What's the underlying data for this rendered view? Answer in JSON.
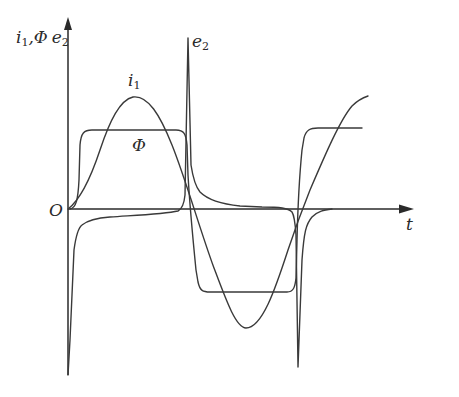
{
  "diagram": {
    "type": "waveform-diagram",
    "axes": {
      "y_label": {
        "parts": [
          "i",
          "1",
          ",Φ",
          "e",
          "2"
        ]
      },
      "x_label": "t",
      "origin_label": "O"
    },
    "curve_labels": {
      "i1": {
        "base": "i",
        "sub": "1"
      },
      "phi": {
        "base": "Φ"
      },
      "e2": {
        "base": "e",
        "sub": "2"
      }
    },
    "colors": {
      "stroke": "#3a3a3a",
      "axis": "#2a2a2a",
      "background": "#ffffff"
    },
    "curves": [
      {
        "name": "i1",
        "description": "sinusoidal primary current"
      },
      {
        "name": "phi",
        "description": "flat-topped flux waveform"
      },
      {
        "name": "e2",
        "description": "secondary EMF peaking spikes"
      }
    ]
  }
}
